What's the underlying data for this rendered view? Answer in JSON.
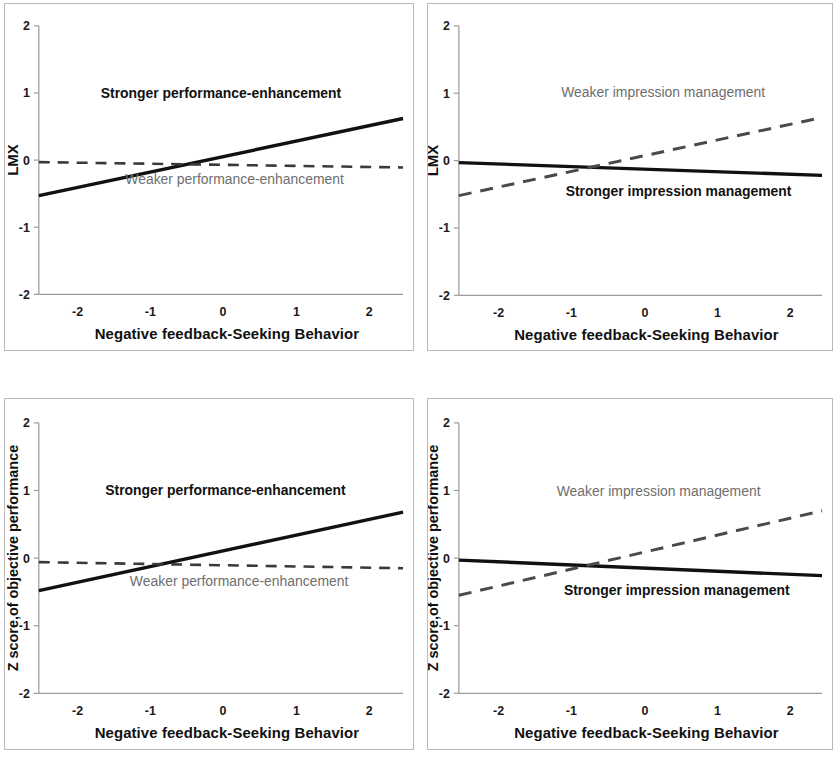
{
  "figure": {
    "panel_count": 4,
    "background_color": "#ffffff",
    "border_color": "#b9b9b9"
  },
  "colors": {
    "solid_line": "#111111",
    "dashed_line": "#4a4a4a",
    "axis": "#9a9a9a",
    "text": "#111111",
    "dashed_label_text": "#6e6e6e"
  },
  "chart_data": [
    {
      "id": "panel-top-left",
      "type": "line",
      "title": "",
      "xlabel": "Negative feedback-Seeking Behavior",
      "ylabel": "LMX",
      "xlim": [
        -2,
        2
      ],
      "ylim": [
        -2,
        2
      ],
      "xticks": [
        "-2",
        "-1",
        "0",
        "1",
        "2"
      ],
      "yticks": [
        "2",
        "1",
        "0",
        "-1",
        "-2"
      ],
      "grid": false,
      "legend_position": "inline-annotation",
      "x": [
        -2,
        2
      ],
      "series": [
        {
          "name": "Stronger performance-enhancement",
          "style": "solid",
          "values": [
            -0.53,
            0.62
          ],
          "label_x": 0.0,
          "label_y": 0.93,
          "label_anchor": "middle"
        },
        {
          "name": "Weaker performance-enhancement",
          "style": "dashed",
          "values": [
            -0.03,
            -0.11
          ],
          "label_x": 0.15,
          "label_y": -0.36,
          "label_anchor": "middle"
        }
      ]
    },
    {
      "id": "panel-top-right",
      "type": "line",
      "title": "",
      "xlabel": "Negative feedback-Seeking Behavior",
      "ylabel": "LMX",
      "xlim": [
        -2,
        2
      ],
      "ylim": [
        -2,
        2
      ],
      "xticks": [
        "-2",
        "-1",
        "0",
        "1",
        "2"
      ],
      "yticks": [
        "2",
        "1",
        "0",
        "-1",
        "-2"
      ],
      "grid": false,
      "legend_position": "inline-annotation",
      "x": [
        -2,
        2
      ],
      "series": [
        {
          "name": "Stronger impression management",
          "style": "solid",
          "values": [
            -0.03,
            -0.22
          ],
          "label_x": 0.42,
          "label_y": -0.52,
          "label_anchor": "middle"
        },
        {
          "name": "Weaker impression management",
          "style": "dashed",
          "values": [
            -0.52,
            0.64
          ],
          "label_x": 0.25,
          "label_y": 0.95,
          "label_anchor": "middle"
        }
      ]
    },
    {
      "id": "panel-bottom-left",
      "type": "line",
      "title": "",
      "xlabel": "Negative feedback-Seeking Behavior",
      "ylabel": "Z score,of objective performance",
      "xlim": [
        -2,
        2
      ],
      "ylim": [
        -2,
        2
      ],
      "xticks": [
        "-2",
        "-1",
        "0",
        "1",
        "2"
      ],
      "yticks": [
        "2",
        "1",
        "0",
        "-1",
        "-2"
      ],
      "grid": false,
      "legend_position": "inline-annotation",
      "x": [
        -2,
        2
      ],
      "series": [
        {
          "name": "Stronger performance-enhancement",
          "style": "solid",
          "values": [
            -0.48,
            0.68
          ],
          "label_x": 0.05,
          "label_y": 0.94,
          "label_anchor": "middle"
        },
        {
          "name": "Weaker performance-enhancement",
          "style": "dashed",
          "values": [
            -0.06,
            -0.15
          ],
          "label_x": 0.2,
          "label_y": -0.42,
          "label_anchor": "middle"
        }
      ]
    },
    {
      "id": "panel-bottom-right",
      "type": "line",
      "title": "",
      "xlabel": "Negative feedback-Seeking Behavior",
      "ylabel": "Z score,of objective performance",
      "xlim": [
        -2,
        2
      ],
      "ylim": [
        -2,
        2
      ],
      "xticks": [
        "-2",
        "-1",
        "0",
        "1",
        "2"
      ],
      "yticks": [
        "2",
        "1",
        "0",
        "-1",
        "-2"
      ],
      "grid": false,
      "legend_position": "inline-annotation",
      "x": [
        -2,
        2
      ],
      "series": [
        {
          "name": "Stronger impression management",
          "style": "solid",
          "values": [
            -0.03,
            -0.26
          ],
          "label_x": 0.4,
          "label_y": -0.55,
          "label_anchor": "middle"
        },
        {
          "name": "Weaker impression management",
          "style": "dashed",
          "values": [
            -0.55,
            0.7
          ],
          "label_x": 0.2,
          "label_y": 0.92,
          "label_anchor": "middle"
        }
      ]
    }
  ]
}
